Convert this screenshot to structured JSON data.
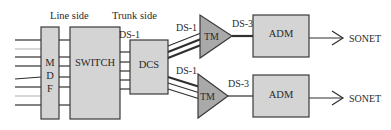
{
  "diagram": {
    "headers": {
      "line_side": "Line side",
      "trunk_side": "Trunk side"
    },
    "nodes": {
      "mdf": {
        "letters": [
          "M",
          "D",
          "F"
        ]
      },
      "switch": "SWITCH",
      "dcs": "DCS",
      "tm_top": "TM",
      "tm_bottom": "TM",
      "adm_top": "ADM",
      "adm_bottom": "ADM"
    },
    "links": {
      "switch_to_dcs": "DS-1",
      "dcs_to_tm_top": "DS-1",
      "dcs_to_tm_bottom": "DS-1",
      "tm_top_to_adm": "DS-3",
      "tm_bottom_to_adm": "DS-3",
      "adm_top_out": "SONET",
      "adm_bottom_out": "SONET"
    },
    "colors": {
      "box_fill": "#d4d4d4",
      "triangle_fill": "#a9a9a9",
      "stroke": "#3a3a3a"
    }
  }
}
